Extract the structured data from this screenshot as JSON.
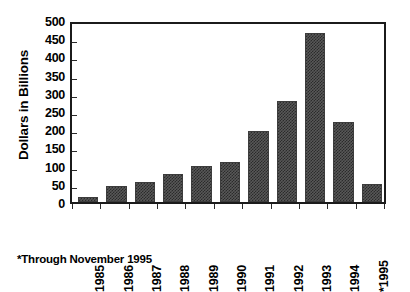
{
  "chart_data": {
    "type": "bar",
    "title": "",
    "xlabel": "",
    "ylabel": "Dollars in Billions",
    "categories": [
      "1985",
      "1986",
      "1987",
      "1988",
      "1989",
      "1990",
      "1991",
      "1992",
      "1993",
      "1994",
      "*1995"
    ],
    "values": [
      13,
      45,
      56,
      76,
      100,
      110,
      195,
      278,
      464,
      220,
      50
    ],
    "ylim": [
      0,
      500
    ],
    "yticks": [
      0,
      50,
      100,
      150,
      200,
      250,
      300,
      350,
      400,
      450,
      500
    ],
    "ytick_labels": [
      "0",
      "50",
      "100",
      "150",
      "200",
      "250",
      "300",
      "350",
      "400",
      "450",
      "500"
    ],
    "grid": false,
    "legend": null,
    "bar_color": "#4a4a4a",
    "frame_color": "#1b1b1b",
    "annotations": [
      "*Through November 1995"
    ]
  },
  "footnote": {
    "text": "*Through November 1995"
  }
}
